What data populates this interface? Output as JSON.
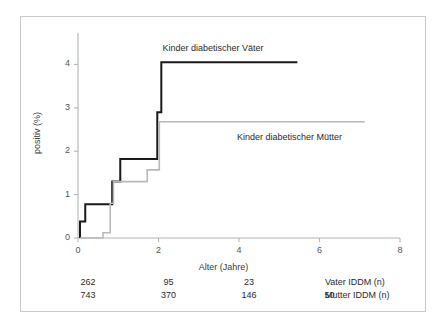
{
  "chart_data": {
    "type": "line",
    "subtype": "step",
    "title": "",
    "xlabel": "Alter (Jahre)",
    "ylabel": "positiv (%)",
    "xlim": [
      0,
      8
    ],
    "ylim": [
      0,
      4.6
    ],
    "xticks": [
      0,
      2,
      4,
      6,
      8
    ],
    "xtick_labels": [
      "0",
      "2",
      "4",
      "6",
      "8"
    ],
    "yticks": [
      0,
      1,
      2,
      3,
      4
    ],
    "ytick_labels": [
      "0",
      "1",
      "2",
      "3",
      "4"
    ],
    "grid": false,
    "legend_position": "inline-annotations",
    "series": [
      {
        "name": "Kinder diabetischer Väter",
        "color": "#1a1a1a",
        "linewidth": 2,
        "label_x": 2.1,
        "label_y": 4.35,
        "points": [
          {
            "x": 0.05,
            "y": 0.0
          },
          {
            "x": 0.05,
            "y": 0.38
          },
          {
            "x": 0.18,
            "y": 0.38
          },
          {
            "x": 0.18,
            "y": 0.78
          },
          {
            "x": 0.85,
            "y": 0.78
          },
          {
            "x": 0.85,
            "y": 1.3
          },
          {
            "x": 1.05,
            "y": 1.3
          },
          {
            "x": 1.05,
            "y": 1.82
          },
          {
            "x": 1.97,
            "y": 1.82
          },
          {
            "x": 1.97,
            "y": 2.9
          },
          {
            "x": 2.07,
            "y": 2.9
          },
          {
            "x": 2.07,
            "y": 4.05
          },
          {
            "x": 5.45,
            "y": 4.05
          }
        ]
      },
      {
        "name": "Kinder diabetischer Mütter",
        "color": "#b8b8b8",
        "linewidth": 1.6,
        "label_x": 3.95,
        "label_y": 2.3,
        "points": [
          {
            "x": 0.05,
            "y": 0.0
          },
          {
            "x": 0.62,
            "y": 0.0
          },
          {
            "x": 0.62,
            "y": 0.12
          },
          {
            "x": 0.8,
            "y": 0.12
          },
          {
            "x": 0.8,
            "y": 0.8
          },
          {
            "x": 0.88,
            "y": 0.8
          },
          {
            "x": 0.88,
            "y": 1.3
          },
          {
            "x": 1.72,
            "y": 1.3
          },
          {
            "x": 1.72,
            "y": 1.57
          },
          {
            "x": 2.02,
            "y": 1.57
          },
          {
            "x": 2.02,
            "y": 2.68
          },
          {
            "x": 7.12,
            "y": 2.68
          }
        ]
      }
    ],
    "annotations": [
      {
        "text": "Kinder diabetischer Väter",
        "x": 2.1,
        "y": 4.35
      },
      {
        "text": "Kinder diabetischer Mütter",
        "x": 3.95,
        "y": 2.3
      }
    ],
    "risk_table": {
      "columns_x": [
        0,
        2,
        4,
        6
      ],
      "rows": [
        {
          "label": "Vater IDDM (n)",
          "values": [
            "262",
            "95",
            "23",
            ""
          ]
        },
        {
          "label": "Mutter IDDM (n)",
          "values": [
            "743",
            "370",
            "146",
            "50"
          ]
        }
      ]
    },
    "colors": {
      "axis": "#b5b5b5",
      "tick_text": "#555555",
      "label_text": "#3a3a3a",
      "frame": "#c9c9c9",
      "background": "#ffffff",
      "series_vater": "#1a1a1a",
      "series_mutter": "#b8b8b8"
    }
  }
}
